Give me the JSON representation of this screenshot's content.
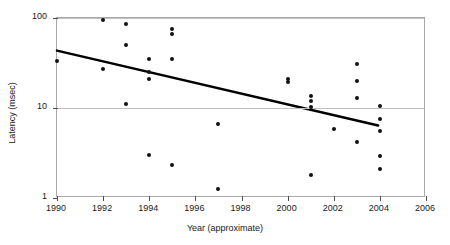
{
  "chart_data": {
    "type": "scatter",
    "title": "",
    "xlabel": "Year (approximate)",
    "ylabel": "Latency (msec)",
    "xlim": [
      1990,
      2006
    ],
    "ylim": [
      1,
      100
    ],
    "yscale": "log",
    "xticks": [
      1990,
      1992,
      1994,
      1996,
      1998,
      2000,
      2002,
      2004,
      2006
    ],
    "xtick_labels": [
      "1990",
      "1992",
      "1994",
      "1996",
      "1998",
      "2000",
      "2002",
      "2004",
      "2006"
    ],
    "yticks": [
      1,
      10,
      100
    ],
    "ytick_labels": [
      "1",
      "10",
      "100"
    ],
    "grid": "horizontal-major",
    "legend": "none",
    "marker": "filled-circle",
    "marker_color": "#111111",
    "points": [
      {
        "x": 1990,
        "y": 33
      },
      {
        "x": 1992,
        "y": 96
      },
      {
        "x": 1992,
        "y": 27
      },
      {
        "x": 1993,
        "y": 85
      },
      {
        "x": 1993,
        "y": 50
      },
      {
        "x": 1993,
        "y": 11
      },
      {
        "x": 1994,
        "y": 35
      },
      {
        "x": 1994,
        "y": 25
      },
      {
        "x": 1994,
        "y": 21
      },
      {
        "x": 1994,
        "y": 3.0
      },
      {
        "x": 1995,
        "y": 76
      },
      {
        "x": 1995,
        "y": 66
      },
      {
        "x": 1995,
        "y": 35
      },
      {
        "x": 1995,
        "y": 2.3
      },
      {
        "x": 1997,
        "y": 6.6
      },
      {
        "x": 1997,
        "y": 1.25
      },
      {
        "x": 2000,
        "y": 21
      },
      {
        "x": 2000,
        "y": 19.5
      },
      {
        "x": 2001,
        "y": 13.7
      },
      {
        "x": 2001,
        "y": 12.0
      },
      {
        "x": 2001,
        "y": 10.3
      },
      {
        "x": 2001,
        "y": 1.8
      },
      {
        "x": 2002,
        "y": 5.9
      },
      {
        "x": 2003,
        "y": 31
      },
      {
        "x": 2003,
        "y": 20
      },
      {
        "x": 2003,
        "y": 13
      },
      {
        "x": 2003,
        "y": 4.2
      },
      {
        "x": 2004,
        "y": 10.5
      },
      {
        "x": 2004,
        "y": 7.5
      },
      {
        "x": 2004,
        "y": 5.6
      },
      {
        "x": 2004,
        "y": 2.9
      },
      {
        "x": 2004,
        "y": 2.1
      }
    ],
    "trendline": {
      "color": "#000000",
      "width": 2.5,
      "x_start": 1990,
      "y_start": 43,
      "x_end": 2004,
      "y_end": 6.2
    }
  }
}
